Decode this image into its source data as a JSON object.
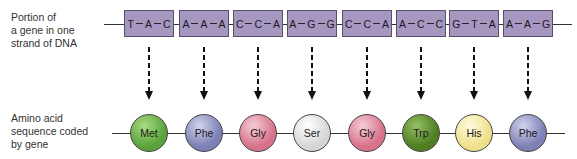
{
  "labels": {
    "dna": [
      "Portion of",
      "a gene in one",
      "strand of DNA"
    ],
    "amino_acid": [
      "Amino acid",
      "sequence coded",
      "by gene"
    ]
  },
  "codons": [
    {
      "bases": [
        "T",
        "A",
        "C"
      ]
    },
    {
      "bases": [
        "A",
        "A",
        "A"
      ]
    },
    {
      "bases": [
        "C",
        "C",
        "A"
      ]
    },
    {
      "bases": [
        "A",
        "G",
        "G"
      ]
    },
    {
      "bases": [
        "C",
        "C",
        "A"
      ]
    },
    {
      "bases": [
        "A",
        "C",
        "C"
      ]
    },
    {
      "bases": [
        "G",
        "T",
        "A"
      ]
    },
    {
      "bases": [
        "A",
        "A",
        "G"
      ]
    }
  ],
  "amino_acids": [
    {
      "name": "Met",
      "color": "#5aa23a",
      "highlight": "#a8dc84"
    },
    {
      "name": "Phe",
      "color": "#7c80b4",
      "highlight": "#d2d4ec"
    },
    {
      "name": "Gly",
      "color": "#d7728a",
      "highlight": "#f6ccd6"
    },
    {
      "name": "Ser",
      "color": "#d4d6d6",
      "highlight": "#ffffff"
    },
    {
      "name": "Gly",
      "color": "#d7728a",
      "highlight": "#f6ccd6"
    },
    {
      "name": "Trp",
      "color": "#4f7d22",
      "highlight": "#95c064"
    },
    {
      "name": "His",
      "color": "#eee08a",
      "highlight": "#fffbe0"
    },
    {
      "name": "Phe",
      "color": "#7c80b4",
      "highlight": "#d2d4ec"
    }
  ],
  "colors": {
    "codon_fill": "#a597bf",
    "codon_border": "#5b4f6e",
    "arrow": "#111111"
  }
}
